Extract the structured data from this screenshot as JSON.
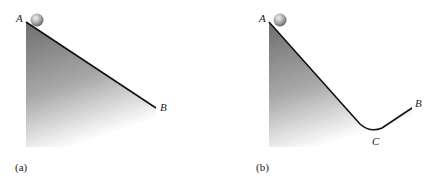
{
  "figures": [
    {
      "caption": "(a)",
      "labels": {
        "start": "A",
        "end": "B"
      },
      "description": "Ball at top of a straight incline from A down to B"
    },
    {
      "caption": "(b)",
      "labels": {
        "start": "A",
        "valley": "C",
        "end": "B"
      },
      "description": "Ball at top of a track descending from A to a valley at C then rising to B"
    }
  ],
  "colors": {
    "track_line": "#111111",
    "fill_dark": "#7a7a7a",
    "fill_light": "#ffffff",
    "ball_light": "#e6e6e6",
    "ball_dark": "#6f6f6f"
  }
}
